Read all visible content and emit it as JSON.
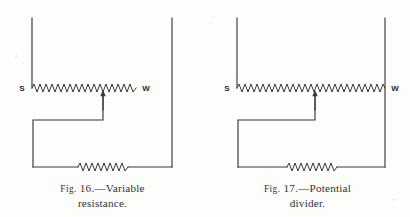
{
  "page": {
    "background_color": "#fdfdfb",
    "ink_color": "#3a3835"
  },
  "figures": [
    {
      "id": "fig-16",
      "caption": {
        "fig_word": "Fig.",
        "number": "16.",
        "dash": "—",
        "title_line1": "Variable",
        "title_line2": "resistance.",
        "full": "Fig. 16.—Variable resistance."
      },
      "labels": {
        "left_terminal": "S",
        "right_terminal": "W"
      },
      "circuit": {
        "type": "variable-resistance",
        "description": "Rheostat connection: slider wiper taps the resistance wire, right-hand end W is unconnected.",
        "components": [
          "supply-line-left",
          "supply-line-right",
          "resistance-wire-SW",
          "slider-wiper-arrow",
          "return-wire",
          "load-resistor"
        ]
      }
    },
    {
      "id": "fig-17",
      "caption": {
        "fig_word": "Fig.",
        "number": "17.",
        "dash": "—",
        "title_line1": "Potential",
        "title_line2": "divider.",
        "full": "Fig. 17.—Potential divider."
      },
      "labels": {
        "left_terminal": "S",
        "right_terminal": "W"
      },
      "circuit": {
        "type": "potential-divider",
        "description": "Potentiometer connection: whole resistance wire S to W is across the supply, wiper taps off a fraction.",
        "components": [
          "supply-line-left",
          "supply-line-right",
          "resistance-wire-SW",
          "slider-wiper-arrow",
          "return-wire",
          "load-resistor"
        ]
      }
    }
  ]
}
